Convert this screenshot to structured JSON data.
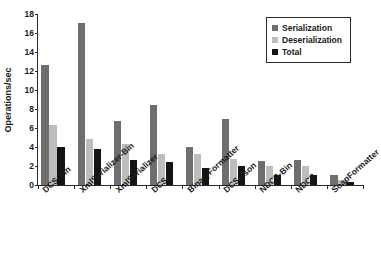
{
  "chart_data": {
    "type": "bar",
    "title": "",
    "subtitle": "",
    "xlabel": "",
    "ylabel": "Operations/sec",
    "ylim": [
      0,
      18
    ],
    "ytick_values": [
      0,
      2,
      4,
      6,
      8,
      10,
      12,
      14,
      16,
      18
    ],
    "ytick_labels": [
      "0",
      "2",
      "4",
      "6",
      "8",
      "10",
      "12",
      "14",
      "16",
      "18"
    ],
    "grid": false,
    "legend_position": "top-right",
    "categories": [
      "DCS-Bin",
      "XmlSerializer-Bin",
      "XmlSerializer",
      "DCS",
      "BinaryFormatter",
      "DCS-Json",
      "NDCS-Bin",
      "NDCS",
      "SoapFormatter"
    ],
    "series": [
      {
        "name": "Serialization",
        "color": "#6e6e6e",
        "values": [
          12.6,
          17.1,
          6.75,
          8.4,
          3.95,
          6.9,
          2.5,
          2.6,
          1.1
        ]
      },
      {
        "name": "Deserialization",
        "color": "#bdbdbd",
        "values": [
          6.35,
          4.8,
          4.3,
          3.25,
          3.25,
          2.7,
          1.95,
          1.95,
          0.55
        ]
      },
      {
        "name": "Total",
        "color": "#141414",
        "values": [
          4.05,
          3.75,
          2.65,
          2.4,
          1.8,
          1.95,
          1.1,
          1.1,
          0.3
        ]
      }
    ]
  },
  "legend": {
    "items": [
      {
        "label": "Serialization",
        "color": "#6e6e6e"
      },
      {
        "label": "Deserialization",
        "color": "#bdbdbd"
      },
      {
        "label": "Total",
        "color": "#141414"
      }
    ]
  },
  "axes": {
    "y_title": "Operations/sec"
  }
}
